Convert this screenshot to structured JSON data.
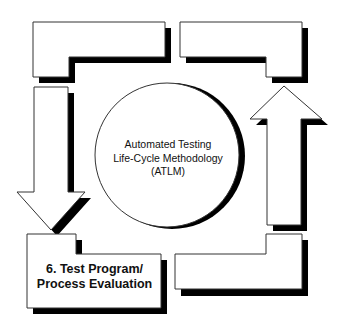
{
  "diagram": {
    "title": "Automated Testing Life-Cycle Methodology (ATLM)",
    "center": {
      "lines": [
        "Automated Testing",
        "Life-Cycle Methodology",
        "(ATLM)"
      ]
    },
    "stages": [
      {
        "id": "top-left",
        "label": ""
      },
      {
        "id": "top-right",
        "label": ""
      },
      {
        "id": "bottom-right",
        "label": ""
      },
      {
        "id": "bottom-left",
        "lines": [
          "6. Test Program/",
          "Process Evaluation"
        ]
      }
    ],
    "arrows": [
      {
        "id": "down-arrow",
        "direction": "down"
      },
      {
        "id": "up-arrow",
        "direction": "up"
      }
    ],
    "colors": {
      "stroke": "#333333",
      "shadow": "#000000",
      "fill": "#ffffff"
    }
  }
}
